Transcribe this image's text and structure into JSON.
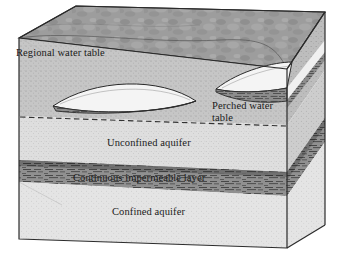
{
  "figure": {
    "type": "geological-block-diagram",
    "width": 339,
    "height": 259
  },
  "labels": {
    "regional_water_table": "Regional water table",
    "perched_water_table_line1": "Perched water",
    "perched_water_table_line2": "table",
    "unconfined_aquifer": "Unconfined aquifer",
    "continuous_impermeable_layer": "Continuous impermeable layer",
    "confined_aquifer": "Confined aquifer"
  },
  "features": [
    {
      "name": "top-soil-surface",
      "description": "mottled ground surface"
    },
    {
      "name": "large-perched-lens",
      "description": "central perched water lens with impermeable base"
    },
    {
      "name": "small-perched-lens",
      "description": "right perched water lens with impermeable base"
    },
    {
      "name": "regional-water-table-line",
      "description": "dashed line across front face"
    },
    {
      "name": "impermeable-layer-band",
      "description": "dark hatched continuous shale layer"
    }
  ],
  "colors": {
    "outline": "#2b2b2b",
    "top_surface": "#9d9d9d",
    "vadose_zone": "#c6c6c6",
    "unconfined_zone": "#dedede",
    "confined_zone": "#e4e4e4",
    "impermeable": "#8a8a8a",
    "impermeable_dark": "#5d5d5d",
    "lens_fill": "#f2f2f2",
    "right_face": "#b4b4b4",
    "label_text": "#1a1a1a"
  }
}
